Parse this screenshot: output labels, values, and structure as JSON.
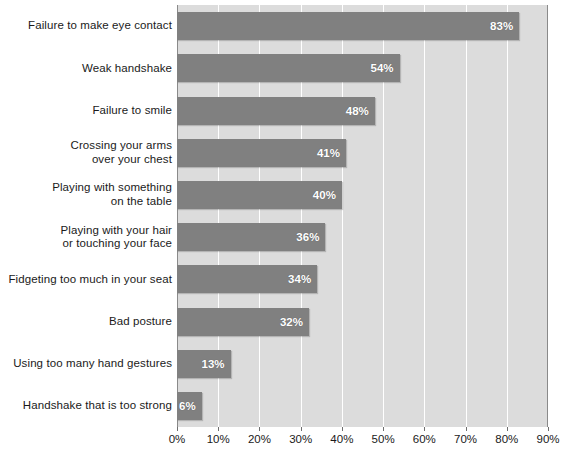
{
  "chart_data": {
    "type": "bar",
    "orientation": "horizontal",
    "title": "",
    "subtitle": "",
    "xlabel": "",
    "ylabel": "",
    "xlim": [
      0,
      90
    ],
    "grid": true,
    "legend": null,
    "value_suffix": "%",
    "xticks": [
      "0%",
      "10%",
      "20%",
      "30%",
      "40%",
      "50%",
      "60%",
      "70%",
      "80%",
      "90%"
    ],
    "xtick_values": [
      0,
      10,
      20,
      30,
      40,
      50,
      60,
      70,
      80,
      90
    ],
    "categories": [
      "Failure to make eye contact",
      "Weak handshake",
      "Failure to smile",
      "Crossing your arms over your chest",
      "Playing with something on the table",
      "Playing with your hair or touching your face",
      "Fidgeting too much in your seat",
      "Bad posture",
      "Using too many hand gestures",
      "Handshake that is too strong"
    ],
    "category_lines": [
      [
        "Failure to make eye contact"
      ],
      [
        "Weak handshake"
      ],
      [
        "Failure to smile"
      ],
      [
        "Crossing your arms",
        "over your chest"
      ],
      [
        "Playing with something",
        "on the table"
      ],
      [
        "Playing with your hair",
        "or touching your face"
      ],
      [
        "Fidgeting too much in your seat"
      ],
      [
        "Bad posture"
      ],
      [
        "Using too many hand gestures"
      ],
      [
        "Handshake that is too strong"
      ]
    ],
    "values": [
      83,
      54,
      48,
      41,
      40,
      36,
      34,
      32,
      13,
      6
    ],
    "data_labels": [
      "83%",
      "54%",
      "48%",
      "41%",
      "40%",
      "36%",
      "34%",
      "32%",
      "13%",
      "6%"
    ],
    "colors": {
      "bar": "#808080",
      "plot_background": "#dcdcdc",
      "gridline": "#ffffff",
      "axis": "#8a8a8a",
      "text": "#1a1a1a",
      "data_label_text": "#ffffff",
      "page_background": "#ffffff"
    }
  }
}
